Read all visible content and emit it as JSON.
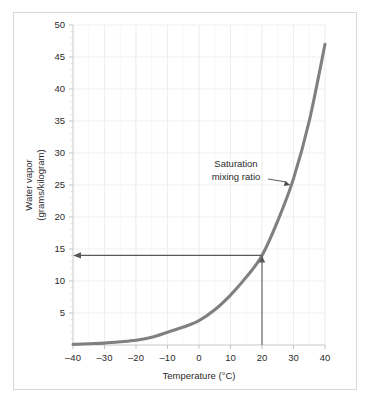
{
  "figure": {
    "background_color": "#ffffff",
    "frame_color": "#d8d8d8",
    "curve_color": "#808080",
    "grid_color": "#f0f0f0",
    "axis_color": "#bdbdbd",
    "text_color": "#2b2b2b",
    "arrow_color": "#595959"
  },
  "chart_data": {
    "type": "line",
    "title": "",
    "xlabel": "Temperature (°C)",
    "ylabel": "Water vapor (grams/kilogram)",
    "ylabel_line1": "Water vapor",
    "ylabel_line2": "(grams/kilogram)",
    "xlim": [
      -40,
      40
    ],
    "ylim": [
      0,
      50
    ],
    "grid": true,
    "legend": "none",
    "xticks": [
      -40,
      -30,
      -20,
      -10,
      0,
      10,
      20,
      30,
      40
    ],
    "xtick_labels": [
      "–40",
      "–30",
      "–20",
      "–10",
      "0",
      "10",
      "20",
      "30",
      "40"
    ],
    "yticks": [
      5,
      10,
      15,
      20,
      25,
      30,
      35,
      40,
      45,
      50
    ],
    "ytick_labels": [
      "5",
      "10",
      "15",
      "20",
      "25",
      "30",
      "35",
      "40",
      "45",
      "50"
    ],
    "x_minor_step": 5,
    "y_minor_step": 1,
    "series": [
      {
        "name": "Saturation mixing ratio",
        "x": [
          -40,
          -35,
          -30,
          -25,
          -20,
          -15,
          -10,
          -5,
          0,
          5,
          10,
          15,
          20,
          25,
          30,
          35,
          40
        ],
        "values": [
          0.1,
          0.2,
          0.3,
          0.5,
          0.75,
          1.2,
          2.0,
          2.8,
          3.8,
          5.5,
          7.8,
          10.6,
          14.0,
          19.4,
          26.0,
          35.0,
          47.0
        ]
      }
    ],
    "annotations": [
      {
        "name": "saturation-mixing-ratio-callout",
        "text_line1": "Saturation",
        "text_line2": "mixing ratio",
        "text": "Saturation mixing ratio",
        "points_to_x": 29,
        "points_to_y": 25
      },
      {
        "name": "temperature-guide-arrow",
        "text": "",
        "from_x": 20,
        "from_y": 0,
        "to_x": 20,
        "to_y": 14
      },
      {
        "name": "mixing-ratio-readout-arrow",
        "text": "",
        "from_x": 20,
        "from_y": 14,
        "to_x": -40,
        "to_y": 14
      }
    ],
    "readout": {
      "temperature": 20,
      "mixing_ratio": 14
    }
  }
}
